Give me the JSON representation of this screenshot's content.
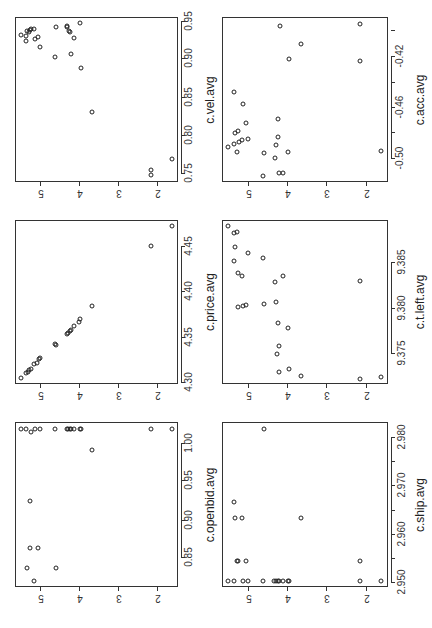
{
  "chart_data": [
    {
      "type": "scatter",
      "id": "vel",
      "xlabel": "c.vel.avg",
      "ylabel": "",
      "x_ticks": [
        "0.75",
        "0.80",
        "0.85",
        "0.90",
        "0.95"
      ],
      "y_ticks": [
        "5",
        "4",
        "3",
        "2"
      ],
      "box": {
        "left": 15,
        "top": 17,
        "right": 178,
        "bottom": 182
      },
      "x_tick_px": [
        173,
        135,
        97,
        58,
        21
      ],
      "y_tick_px": [
        40,
        79,
        118,
        157
      ],
      "points_px": [
        [
          21,
          35
        ],
        [
          26,
          36
        ],
        [
          26,
          41
        ],
        [
          27,
          31
        ],
        [
          29,
          32
        ],
        [
          30,
          30
        ],
        [
          31,
          29
        ],
        [
          34,
          29
        ],
        [
          35,
          39
        ],
        [
          38,
          37
        ],
        [
          40,
          47
        ],
        [
          55,
          57
        ],
        [
          56,
          27
        ],
        [
          67,
          26
        ],
        [
          67,
          27
        ],
        [
          69,
          31
        ],
        [
          70,
          32
        ],
        [
          71,
          54
        ],
        [
          74,
          38
        ],
        [
          80,
          23
        ],
        [
          81,
          68
        ],
        [
          92,
          112
        ],
        [
          151,
          170
        ],
        [
          151,
          175
        ],
        [
          172,
          159
        ]
      ]
    },
    {
      "type": "scatter",
      "id": "acc",
      "xlabel": "c.acc.avg",
      "ylabel": "",
      "x_ticks": [
        "-0.50",
        "-0.46",
        "-0.42"
      ],
      "y_ticks": [
        "5",
        "4",
        "3",
        "2"
      ],
      "box": {
        "left": 222,
        "top": 17,
        "right": 388,
        "bottom": 182
      },
      "x_tick_px": [
        158,
        107,
        56
      ],
      "x_minor_tick_px": [
        132,
        82,
        30
      ],
      "y_tick_px": [
        248,
        287,
        326,
        366
      ],
      "points_px": [
        [
          228,
          147
        ],
        [
          234,
          92
        ],
        [
          234,
          144
        ],
        [
          235,
          133
        ],
        [
          237,
          152
        ],
        [
          238,
          131
        ],
        [
          239,
          142
        ],
        [
          242,
          140
        ],
        [
          243,
          104
        ],
        [
          246,
          123
        ],
        [
          248,
          139
        ],
        [
          263,
          176
        ],
        [
          264,
          153
        ],
        [
          275,
          158
        ],
        [
          276,
          145
        ],
        [
          278,
          119
        ],
        [
          278,
          137
        ],
        [
          279,
          173
        ],
        [
          280,
          26
        ],
        [
          283,
          173
        ],
        [
          288,
          152
        ],
        [
          289,
          59
        ],
        [
          301,
          44
        ],
        [
          360,
          24
        ],
        [
          360,
          61
        ],
        [
          381,
          151
        ]
      ]
    },
    {
      "type": "scatter",
      "id": "price",
      "xlabel": "c.price.avg",
      "ylabel": "",
      "x_ticks": [
        "4.30",
        "4.35",
        "4.40",
        "4.45"
      ],
      "y_ticks": [
        "5",
        "4",
        "3",
        "2"
      ],
      "box": {
        "left": 15,
        "top": 220,
        "right": 178,
        "bottom": 384
      },
      "x_tick_px": [
        382,
        337,
        291,
        246
      ],
      "y_tick_px": [
        40,
        79,
        118,
        157
      ],
      "points_px": [
        [
          21,
          378
        ],
        [
          26,
          373
        ],
        [
          28,
          372
        ],
        [
          29,
          370
        ],
        [
          31,
          369
        ],
        [
          34,
          364
        ],
        [
          37,
          363
        ],
        [
          39,
          359
        ],
        [
          40,
          358
        ],
        [
          55,
          344
        ],
        [
          56,
          345
        ],
        [
          67,
          334
        ],
        [
          68,
          333
        ],
        [
          70,
          331
        ],
        [
          71,
          330
        ],
        [
          74,
          326
        ],
        [
          79,
          322
        ],
        [
          80,
          319
        ],
        [
          92,
          306
        ],
        [
          151,
          246
        ],
        [
          172,
          226
        ]
      ]
    },
    {
      "type": "scatter",
      "id": "tleft",
      "xlabel": "c.t.left.avg",
      "ylabel": "",
      "x_ticks": [
        "9.375",
        "9.380",
        "9.385"
      ],
      "y_ticks": [
        "5",
        "4",
        "3",
        "2"
      ],
      "box": {
        "left": 222,
        "top": 220,
        "right": 388,
        "bottom": 384
      },
      "x_tick_px": [
        353,
        308,
        262
      ],
      "y_tick_px": [
        248,
        287,
        326,
        366
      ],
      "points_px": [
        [
          228,
          226
        ],
        [
          234,
          233
        ],
        [
          237,
          232
        ],
        [
          235,
          247
        ],
        [
          248,
          253
        ],
        [
          234,
          261
        ],
        [
          263,
          258
        ],
        [
          238,
          273
        ],
        [
          242,
          276
        ],
        [
          275,
          282
        ],
        [
          283,
          276
        ],
        [
          360,
          281
        ],
        [
          238,
          307
        ],
        [
          243,
          306
        ],
        [
          246,
          305
        ],
        [
          264,
          304
        ],
        [
          276,
          302
        ],
        [
          278,
          323
        ],
        [
          288,
          328
        ],
        [
          279,
          346
        ],
        [
          277,
          354
        ],
        [
          279,
          372
        ],
        [
          289,
          369
        ],
        [
          301,
          376
        ],
        [
          360,
          379
        ],
        [
          381,
          377
        ]
      ]
    },
    {
      "type": "scatter",
      "id": "openbid",
      "xlabel": "c.openbid.avg",
      "ylabel": "",
      "x_ticks": [
        "0.85",
        "0.90",
        "0.95",
        "1.00"
      ],
      "y_ticks": [
        "5",
        "4",
        "3",
        "2"
      ],
      "box": {
        "left": 15,
        "top": 422,
        "right": 178,
        "bottom": 587
      },
      "x_tick_px": [
        557,
        520,
        480,
        443
      ],
      "y_tick_px": [
        40,
        79,
        118,
        157
      ],
      "points_px": [
        [
          21,
          429
        ],
        [
          26,
          429
        ],
        [
          31,
          432
        ],
        [
          35,
          429
        ],
        [
          40,
          429
        ],
        [
          55,
          429
        ],
        [
          67,
          429
        ],
        [
          68,
          429
        ],
        [
          70,
          429
        ],
        [
          71,
          429
        ],
        [
          74,
          429
        ],
        [
          80,
          429
        ],
        [
          81,
          429
        ],
        [
          151,
          429
        ],
        [
          172,
          429
        ],
        [
          92,
          450
        ],
        [
          30,
          501
        ],
        [
          30,
          548
        ],
        [
          38,
          548
        ],
        [
          27,
          568
        ],
        [
          56,
          568
        ],
        [
          34,
          581
        ]
      ]
    },
    {
      "type": "scatter",
      "id": "ship",
      "xlabel": "c.ship.avg",
      "ylabel": "",
      "x_ticks": [
        "2.950",
        "2.960",
        "2.970",
        "2.980"
      ],
      "y_ticks": [
        "5",
        "4",
        "3",
        "2"
      ],
      "box": {
        "left": 222,
        "top": 422,
        "right": 388,
        "bottom": 587
      },
      "x_tick_px": [
        582,
        534,
        485,
        437
      ],
      "x_minor_tick_px": [
        558,
        510,
        461
      ],
      "y_tick_px": [
        248,
        287,
        326,
        366
      ],
      "points_px": [
        [
          264,
          429
        ],
        [
          234,
          502
        ],
        [
          235,
          518
        ],
        [
          242,
          518
        ],
        [
          301,
          518
        ],
        [
          237,
          561
        ],
        [
          238,
          561
        ],
        [
          246,
          561
        ],
        [
          360,
          561
        ],
        [
          228,
          581
        ],
        [
          234,
          581
        ],
        [
          243,
          581
        ],
        [
          248,
          581
        ],
        [
          263,
          581
        ],
        [
          274,
          581
        ],
        [
          276,
          581
        ],
        [
          278,
          581
        ],
        [
          279,
          581
        ],
        [
          283,
          581
        ],
        [
          288,
          581
        ],
        [
          289,
          581
        ],
        [
          360,
          581
        ],
        [
          381,
          581
        ]
      ]
    }
  ]
}
